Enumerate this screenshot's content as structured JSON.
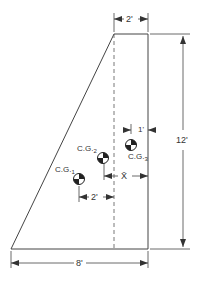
{
  "diagram": {
    "type": "centroid figure (trapezoid composed of triangle + rectangle)",
    "dimensions": {
      "top_width": "2'",
      "height": "12'",
      "base_width": "8'",
      "cg2_offset": "2'",
      "cg3_offset": "1'",
      "xbar": "X̄"
    },
    "labels": {
      "cg1": "C.G.",
      "cg1_sub": "1",
      "cg2": "C.G.",
      "cg2_sub": "2",
      "cg3": "C.G.",
      "cg3_sub": "3"
    },
    "colors": {
      "line": "#333333",
      "background": "#ffffff"
    }
  }
}
